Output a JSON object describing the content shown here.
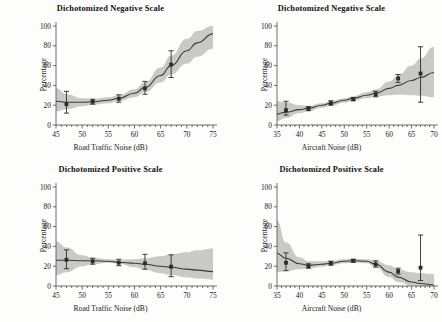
{
  "figure": {
    "width": 442,
    "height": 322,
    "background": "#fdfdfc",
    "band_color": "#b4b4b4",
    "line_color": "#3a3a3a",
    "marker_color": "#2b2b2b",
    "axis_color": "#4a4a4a"
  },
  "chart_data": [
    {
      "type": "line",
      "panel": "top-left",
      "title": "Dichotomized Negative Scale",
      "xlabel": "Road Traffic Noise (dB)",
      "ylabel": "Percentage",
      "xlim": [
        45,
        75
      ],
      "ylim": [
        0,
        100
      ],
      "xticks": [
        45,
        50,
        55,
        60,
        65,
        70,
        75
      ],
      "yticks": [
        0,
        20,
        40,
        60,
        80,
        100
      ],
      "grid": false,
      "legend": "none",
      "points": {
        "x": [
          47,
          52,
          57,
          62,
          67
        ],
        "y": [
          21,
          23.5,
          26.5,
          37,
          61
        ],
        "err_low": [
          9,
          2.5,
          3.5,
          6,
          13
        ],
        "err_high": [
          13,
          2.5,
          4,
          7,
          14
        ]
      },
      "fit_curve": {
        "x": [
          45,
          47,
          50,
          52,
          55,
          57,
          60,
          62,
          65,
          67,
          70,
          72,
          75
        ],
        "y": [
          24,
          23,
          23,
          23.5,
          25,
          27,
          32,
          38,
          50,
          60,
          75,
          83,
          92
        ]
      },
      "band_upper": {
        "x": [
          45,
          47,
          50,
          52,
          55,
          57,
          60,
          62,
          65,
          67,
          70,
          72,
          75
        ],
        "y": [
          37,
          31,
          27,
          26.5,
          28,
          30,
          36,
          43,
          58,
          70,
          87,
          95,
          100
        ]
      },
      "band_lower": {
        "x": [
          45,
          47,
          50,
          52,
          55,
          57,
          60,
          62,
          65,
          67,
          70,
          72,
          75
        ],
        "y": [
          14,
          16,
          19,
          20.5,
          22,
          24,
          28,
          33,
          43,
          51,
          62,
          69,
          77
        ]
      }
    },
    {
      "type": "line",
      "panel": "top-right",
      "title": "Dichotomized Negative Scale",
      "xlabel": "Aircraft Noise (dB)",
      "ylabel": "Percentage",
      "xlim": [
        35,
        70
      ],
      "ylim": [
        0,
        100
      ],
      "xticks": [
        35,
        40,
        45,
        50,
        55,
        60,
        65,
        70
      ],
      "yticks": [
        0,
        20,
        40,
        60,
        80,
        100
      ],
      "grid": false,
      "legend": "none",
      "points": {
        "x": [
          37,
          42,
          47,
          52,
          57,
          62,
          67
        ],
        "y": [
          15,
          16.5,
          22,
          26,
          31,
          47,
          52
        ],
        "err_low": [
          5,
          2,
          2,
          1.5,
          2.5,
          4,
          29
        ],
        "err_high": [
          9,
          2,
          2.5,
          1.5,
          3,
          4,
          27
        ]
      },
      "fit_curve": {
        "x": [
          35,
          37,
          40,
          42,
          45,
          47,
          50,
          52,
          55,
          57,
          60,
          62,
          65,
          67,
          70
        ],
        "y": [
          11,
          13,
          15.5,
          17,
          20,
          22,
          25,
          27,
          30,
          32,
          37,
          40,
          45,
          48,
          53
        ]
      },
      "band_upper": {
        "x": [
          35,
          37,
          40,
          42,
          45,
          47,
          50,
          52,
          55,
          57,
          60,
          62,
          65,
          67,
          70
        ],
        "y": [
          24,
          23,
          20,
          19.5,
          22,
          24,
          27,
          29,
          33,
          36,
          44,
          50,
          60,
          67,
          79
        ]
      },
      "band_lower": {
        "x": [
          35,
          37,
          40,
          42,
          45,
          47,
          50,
          52,
          55,
          57,
          60,
          62,
          65,
          67,
          70
        ],
        "y": [
          4,
          7,
          12,
          14,
          17.5,
          19.5,
          22.5,
          24.5,
          27,
          28.5,
          30,
          30.5,
          30,
          29.5,
          28
        ]
      }
    },
    {
      "type": "line",
      "panel": "bottom-left",
      "title": "Dichotomized Positive Scale",
      "xlabel": "Road Traffic Noise (dB)",
      "ylabel": "Percentage",
      "xlim": [
        45,
        75
      ],
      "ylim": [
        0,
        100
      ],
      "xticks": [
        45,
        50,
        55,
        60,
        65,
        70,
        75
      ],
      "yticks": [
        0,
        20,
        40,
        60,
        80,
        100
      ],
      "grid": false,
      "legend": "none",
      "points": {
        "x": [
          47,
          52,
          57,
          62,
          67
        ],
        "y": [
          26.5,
          25,
          23.5,
          23,
          19.5
        ],
        "err_low": [
          9,
          3,
          3,
          6,
          10
        ],
        "err_high": [
          10,
          3,
          3.5,
          9,
          12
        ]
      },
      "fit_curve": {
        "x": [
          45,
          47,
          50,
          52,
          55,
          57,
          60,
          62,
          65,
          67,
          70,
          72,
          75
        ],
        "y": [
          26,
          26,
          25.5,
          25.5,
          25,
          24,
          23,
          22,
          20,
          19,
          17,
          16,
          14.5
        ]
      },
      "band_upper": {
        "x": [
          45,
          47,
          50,
          52,
          55,
          57,
          60,
          62,
          65,
          67,
          70,
          72,
          75
        ],
        "y": [
          45,
          39,
          31,
          28.5,
          27,
          26.5,
          27,
          28,
          30,
          32,
          34,
          36,
          38
        ]
      },
      "band_lower": {
        "x": [
          45,
          47,
          50,
          52,
          55,
          57,
          60,
          62,
          65,
          67,
          70,
          72,
          75
        ],
        "y": [
          11,
          14,
          20,
          22,
          23.5,
          22.5,
          19,
          16.5,
          13,
          11,
          8.5,
          7.5,
          6.5
        ]
      }
    },
    {
      "type": "line",
      "panel": "bottom-right",
      "title": "Dichotomized Positive Scale",
      "xlabel": "Aircraft Noise (dB)",
      "ylabel": "Percentage",
      "xlim": [
        35,
        70
      ],
      "ylim": [
        0,
        100
      ],
      "xticks": [
        35,
        40,
        45,
        50,
        55,
        60,
        65,
        70
      ],
      "yticks": [
        0,
        20,
        40,
        60,
        80,
        100
      ],
      "grid": false,
      "legend": "none",
      "points": {
        "x": [
          37,
          42,
          47,
          52,
          57,
          62,
          67
        ],
        "y": [
          23.5,
          20,
          23,
          25.5,
          22,
          15,
          18.5
        ],
        "err_low": [
          8,
          2,
          2,
          1.5,
          3,
          3,
          13
        ],
        "err_high": [
          10,
          2.5,
          2,
          1.5,
          3.5,
          3,
          33
        ]
      },
      "fit_curve": {
        "x": [
          35,
          37,
          40,
          42,
          45,
          47,
          50,
          52,
          55,
          57,
          60,
          62,
          65,
          67,
          70
        ],
        "y": [
          33,
          28,
          22.5,
          21,
          22,
          23,
          25,
          25.5,
          25,
          22,
          14,
          9,
          4,
          2.5,
          1
        ]
      },
      "band_upper": {
        "x": [
          35,
          37,
          40,
          42,
          45,
          47,
          50,
          52,
          55,
          57,
          60,
          62,
          65,
          67,
          70
        ],
        "y": [
          66,
          44,
          29,
          25,
          25,
          25.5,
          27,
          27.5,
          27,
          25.5,
          21,
          17,
          14,
          13,
          12
        ]
      },
      "band_lower": {
        "x": [
          35,
          37,
          40,
          42,
          45,
          47,
          50,
          52,
          55,
          57,
          60,
          62,
          65,
          67,
          70
        ],
        "y": [
          14,
          15,
          17,
          18,
          19.5,
          21,
          23,
          23.5,
          23,
          19,
          9,
          4,
          0.5,
          0,
          0
        ]
      }
    }
  ]
}
